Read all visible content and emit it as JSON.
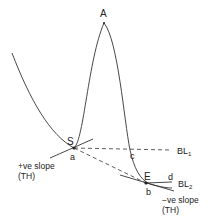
{
  "diagram": {
    "peak_label": "A",
    "start_label": "S",
    "end_label": "E",
    "point_a": "a",
    "point_b": "b",
    "point_c": "c",
    "point_d": "d",
    "baseline_1": {
      "main": "BL",
      "sub": "1"
    },
    "baseline_2": {
      "main": "BL",
      "sub": "2"
    },
    "left_slope": {
      "line1": "+ve slope",
      "line2": "(TH)"
    },
    "right_slope": {
      "line1": "−ve slope",
      "line2": "(TH)"
    }
  },
  "colors": {
    "line": "#333333",
    "text": "#222222",
    "background": "#ffffff"
  }
}
